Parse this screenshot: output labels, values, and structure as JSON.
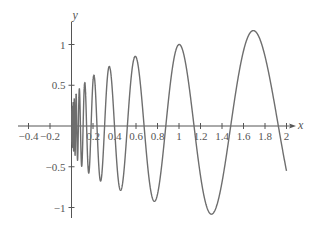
{
  "chart_data": {
    "type": "line",
    "title": "",
    "xlabel": "x",
    "ylabel": "y",
    "xlim": [
      -0.45,
      2.05
    ],
    "ylim": [
      -1.15,
      1.3
    ],
    "grid": false,
    "legend": null,
    "x_ticks": [
      -0.4,
      -0.2,
      0.2,
      0.4,
      0.6,
      0.8,
      1,
      1.2,
      1.4,
      1.6,
      1.8,
      2
    ],
    "x_tick_labels": [
      "−0.4",
      "−0.2",
      "0.2",
      "0.4",
      "0.6",
      "0.8",
      "1",
      "1.2",
      "1.4",
      "1.6",
      "1.8",
      "2"
    ],
    "y_ticks": [
      1,
      0.5,
      -0.5,
      -1
    ],
    "y_tick_labels": [
      "1",
      "0.5",
      "−0.5",
      "−1"
    ],
    "series": [
      {
        "name": "curve",
        "color": "#6e6e6e",
        "description": "oscillation with frequency decreasing and amplitude growing as x increases, approximately y = x^0.3 * cos(12 ln x) for 0 < x <= 2",
        "model": {
          "amp_exponent": 0.3,
          "log_freq": 12,
          "x_start": 0.003,
          "x_end": 2
        },
        "key_points": [
          {
            "x": 0.2,
            "y": 0.63,
            "kind": "max"
          },
          {
            "x": 0.35,
            "y": 0.74,
            "kind": "max"
          },
          {
            "x": 0.59,
            "y": 0.85,
            "kind": "max"
          },
          {
            "x": 0.46,
            "y": -0.8,
            "kind": "min"
          },
          {
            "x": 0.77,
            "y": -0.93,
            "kind": "min"
          },
          {
            "x": 1.0,
            "y": 1.0,
            "kind": "max"
          },
          {
            "x": 1.3,
            "y": -1.08,
            "kind": "min"
          },
          {
            "x": 1.69,
            "y": 1.17,
            "kind": "max"
          },
          {
            "x": 2.0,
            "y": -0.54,
            "kind": "end"
          }
        ]
      }
    ]
  },
  "colors": {
    "axis": "#555555",
    "curve": "#6e6e6e",
    "background": "#ffffff"
  }
}
